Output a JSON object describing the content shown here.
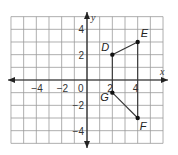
{
  "diagram": {
    "type": "coordinate-plane",
    "axes": {
      "x_label": "x",
      "y_label": "y"
    },
    "x_range": [
      -6,
      6
    ],
    "y_range": [
      -5,
      5
    ],
    "x_ticks": [
      {
        "value": -4,
        "label": "−4"
      },
      {
        "value": -2,
        "label": "−2"
      },
      {
        "value": 0,
        "label": "0"
      },
      {
        "value": 2,
        "label": "2"
      },
      {
        "value": 4,
        "label": "4"
      }
    ],
    "y_ticks": [
      {
        "value": 4,
        "label": "4"
      },
      {
        "value": 2,
        "label": "2"
      },
      {
        "value": -2,
        "label": "−2"
      },
      {
        "value": -4,
        "label": "−4"
      }
    ],
    "points": [
      {
        "name": "D",
        "x": 2,
        "y": 2
      },
      {
        "name": "E",
        "x": 4,
        "y": 3
      },
      {
        "name": "F",
        "x": 4,
        "y": -3
      },
      {
        "name": "G",
        "x": 2,
        "y": -1
      }
    ],
    "segments": [
      [
        "D",
        "E"
      ],
      [
        "E",
        "F"
      ],
      [
        "F",
        "G"
      ],
      [
        "G",
        "D"
      ]
    ],
    "colors": {
      "grid": "#9a9a9a",
      "axis": "#222222",
      "line": "#333333",
      "point": "#111111"
    }
  }
}
